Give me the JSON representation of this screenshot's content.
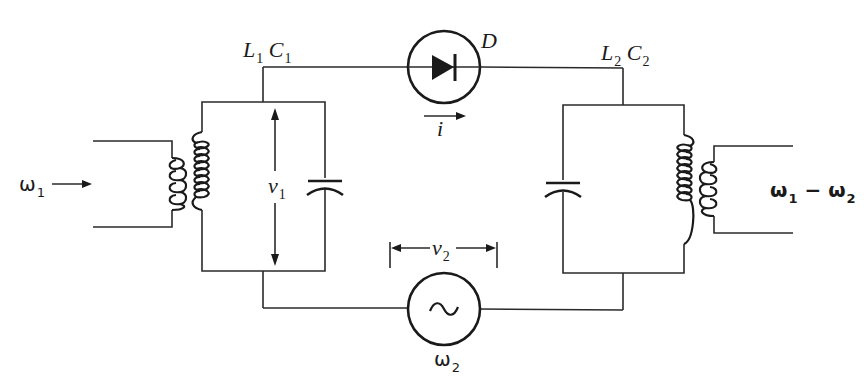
{
  "diagram": {
    "type": "circuit-schematic",
    "colors": {
      "ink": "#1a1a1a",
      "background": "#ffffff"
    },
    "labels": {
      "input_freq": {
        "symbol": "ω",
        "sub": "1"
      },
      "tank1": {
        "L": "L",
        "L_sub": "1",
        "C": "C",
        "C_sub": "1"
      },
      "tank2": {
        "L": "L",
        "L_sub": "2",
        "C": "C",
        "C_sub": "2"
      },
      "diode": "D",
      "current": "i",
      "voltage1": {
        "symbol": "v",
        "sub": "1"
      },
      "voltage2": {
        "symbol": "v",
        "sub": "2"
      },
      "source_freq": {
        "symbol": "ω",
        "sub": "2"
      },
      "source_symbol": "~",
      "output_freq": {
        "a": "ω",
        "a_sub": "1",
        "op": " − ",
        "b": "ω",
        "b_sub": "2"
      }
    },
    "components": [
      {
        "id": "input-transformer",
        "kind": "transformer",
        "primary_turns": 4,
        "secondary_turns": 8
      },
      {
        "id": "C1",
        "kind": "capacitor"
      },
      {
        "id": "D",
        "kind": "diode",
        "direction": "left-to-right"
      },
      {
        "id": "source",
        "kind": "ac-source",
        "frequency": "ω2"
      },
      {
        "id": "C2",
        "kind": "capacitor"
      },
      {
        "id": "output-transformer",
        "kind": "transformer",
        "primary_turns": 8,
        "secondary_turns": 4
      }
    ]
  }
}
